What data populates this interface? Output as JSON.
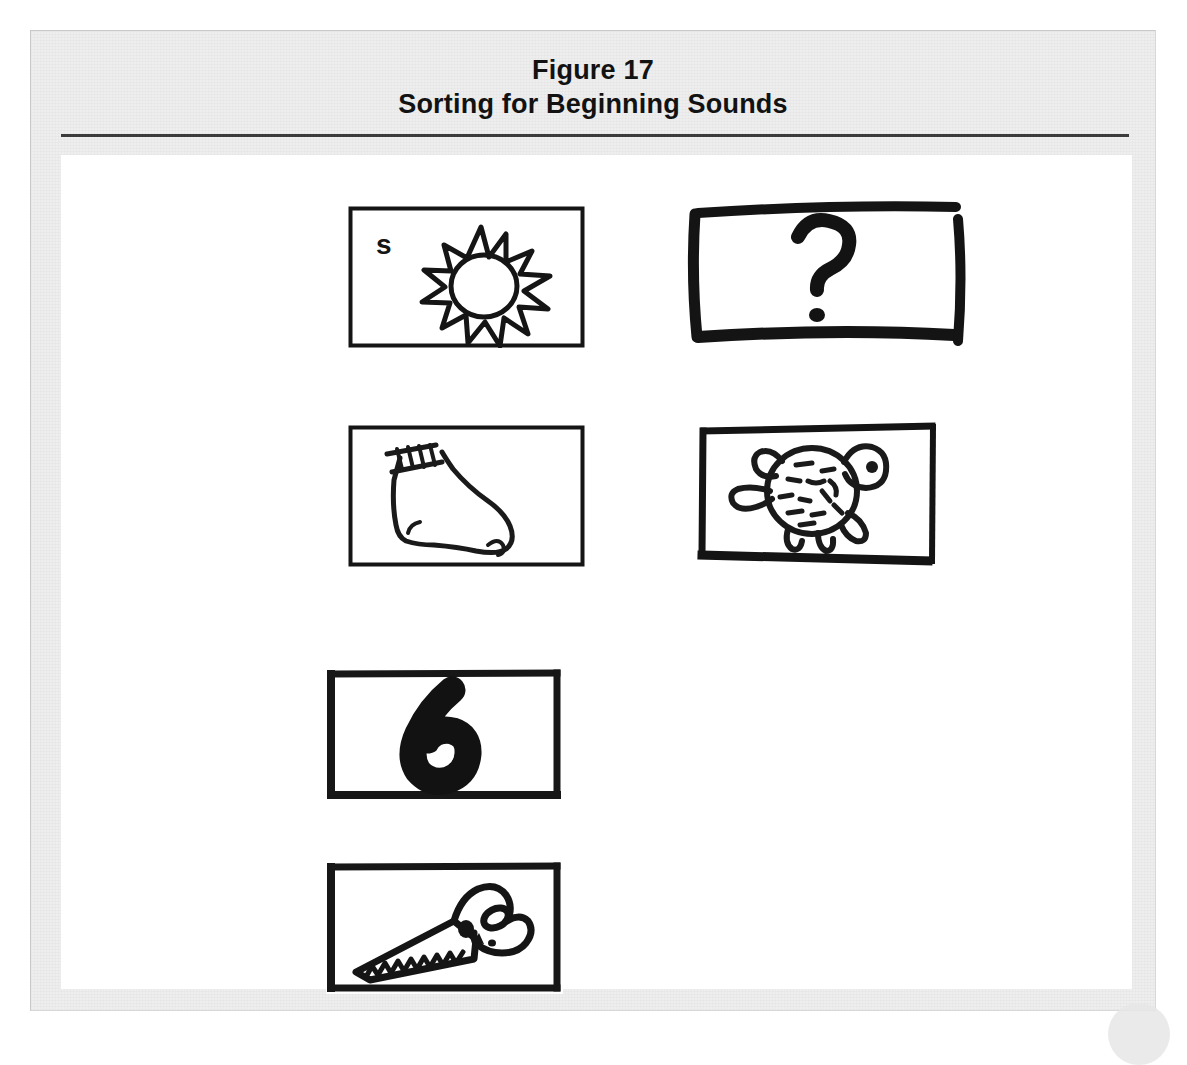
{
  "figure": {
    "title_line1": "Figure 17",
    "title_line2": "Sorting for Beginning Sounds",
    "page_background": "#ffffff",
    "panel_background": "#eeeeee",
    "plate_background": "#ffffff",
    "rule_color": "#3b3b3b",
    "ink_color": "#111111"
  },
  "cards": [
    {
      "id": "card-sun",
      "row": 1,
      "column": 1,
      "picture": "sun",
      "letter_label": "s",
      "border_style": "thin-printed",
      "caption": "Sun picture card labeled with the letter s"
    },
    {
      "id": "card-question-mark",
      "row": 1,
      "column": 2,
      "picture": "question-mark",
      "letter_label": "",
      "border_style": "thick-hand-drawn",
      "caption": "Hand-drawn card showing a question mark"
    },
    {
      "id": "card-sock",
      "row": 2,
      "column": 1,
      "picture": "sock",
      "letter_label": "",
      "border_style": "thin-printed",
      "caption": "Sock picture card"
    },
    {
      "id": "card-turtle",
      "row": 2,
      "column": 2,
      "picture": "turtle",
      "letter_label": "",
      "border_style": "thick-hand-drawn",
      "caption": "Turtle picture card"
    },
    {
      "id": "card-six",
      "row": 3,
      "column": 1,
      "picture": "numeral-six",
      "letter_label": "6",
      "border_style": "thick-hand-drawn",
      "caption": "Card showing the numeral 6"
    },
    {
      "id": "card-saw",
      "row": 4,
      "column": 1,
      "picture": "saw",
      "letter_label": "",
      "border_style": "thick-hand-drawn",
      "caption": "Hand saw picture card"
    }
  ]
}
